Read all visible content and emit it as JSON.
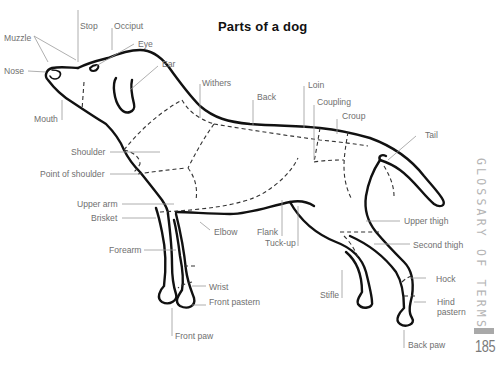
{
  "title": "Parts of a dog",
  "side_heading": "GLOSSARY OF TERMS",
  "page_number": "185",
  "labels": {
    "stop": "Stop",
    "occiput": "Occiput",
    "muzzle": "Muzzle",
    "eye": "Eye",
    "nose": "Nose",
    "ear": "Ear",
    "mouth": "Mouth",
    "withers": "Withers",
    "back": "Back",
    "loin": "Loin",
    "coupling": "Coupling",
    "croup": "Croup",
    "tail": "Tail",
    "shoulder": "Shoulder",
    "point_of_shoulder": "Point of shoulder",
    "upper_arm": "Upper arm",
    "brisket": "Brisket",
    "elbow": "Elbow",
    "flank": "Flank",
    "tuck_up": "Tuck-up",
    "upper_thigh": "Upper thigh",
    "second_thigh": "Second thigh",
    "forearm": "Forearm",
    "hock": "Hock",
    "wrist": "Wrist",
    "front_pastern": "Front pastern",
    "stifle": "Stifle",
    "hind_pastern_1": "Hind",
    "hind_pastern_2": "pastern",
    "front_paw": "Front paw",
    "back_paw": "Back paw"
  }
}
